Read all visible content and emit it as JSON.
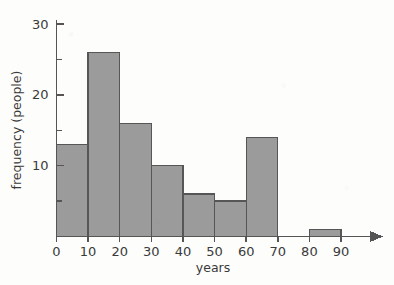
{
  "chart_data": {
    "type": "bar",
    "title": "",
    "subtitle": "",
    "xlabel": "years",
    "ylabel": "frequency (people)",
    "bin_width": 10,
    "bin_edges": [
      0,
      10,
      20,
      30,
      40,
      50,
      60,
      70,
      80,
      90
    ],
    "categories": [
      "0-10",
      "10-20",
      "20-30",
      "30-40",
      "40-50",
      "50-60",
      "60-70",
      "70-80",
      "80-90"
    ],
    "values": [
      13,
      26,
      16,
      10,
      6,
      5,
      14,
      0,
      1
    ],
    "xlim": [
      0,
      95
    ],
    "ylim": [
      0,
      31
    ],
    "x_ticks": [
      0,
      10,
      20,
      30,
      40,
      50,
      60,
      70,
      80,
      90
    ],
    "x_tick_labels": [
      "0",
      "10",
      "20",
      "30",
      "40",
      "50",
      "60",
      "70",
      "80",
      "90"
    ],
    "y_ticks": [
      10,
      20,
      30
    ],
    "y_tick_labels": [
      "10",
      "20",
      "30"
    ],
    "y_minor_ticks": [
      5,
      15,
      25
    ],
    "grid": false,
    "legend": null,
    "legend_position": "none",
    "annotations": [],
    "bar_fill_color": "#9b9b9b",
    "bar_edge_color": "#565656",
    "axis_color": "#555555",
    "background_color": "#fdfdfb",
    "x_axis_has_arrow": true
  },
  "figure": {
    "x_axis_label": "years",
    "y_axis_label": "frequency (people)"
  }
}
